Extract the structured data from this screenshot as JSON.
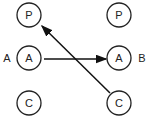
{
  "diagram": {
    "side_labels": {
      "left": "A",
      "right": "B"
    },
    "nodes": [
      {
        "id": "left-p",
        "label": "P",
        "x": 29,
        "y": 15
      },
      {
        "id": "left-a",
        "label": "A",
        "x": 29,
        "y": 58
      },
      {
        "id": "left-c",
        "label": "C",
        "x": 29,
        "y": 103
      },
      {
        "id": "right-p",
        "label": "P",
        "x": 119,
        "y": 15
      },
      {
        "id": "right-a",
        "label": "A",
        "x": 119,
        "y": 58
      },
      {
        "id": "right-c",
        "label": "C",
        "x": 119,
        "y": 103
      }
    ],
    "edges": [
      {
        "from": "left-a",
        "to": "right-a"
      },
      {
        "from": "right-c",
        "to": "left-p"
      }
    ]
  }
}
